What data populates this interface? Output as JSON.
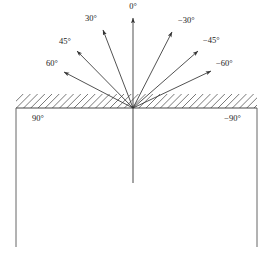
{
  "figure": {
    "background_color": "#ffffff",
    "line_color": "#333333",
    "hatch_color": "#555555",
    "text_color": "#1a1a1a",
    "origin": {
      "x": 133,
      "y": 108
    },
    "surface_line": {
      "x1": 16,
      "y": 108,
      "x2": 257,
      "y2": 108
    },
    "hatch_band": {
      "x": 16,
      "y": 94,
      "width": 241,
      "height": 14,
      "angle_deg": 45
    },
    "box": {
      "x": 16,
      "y": 108,
      "width": 241,
      "height": 139
    },
    "normal_down_line": {
      "x1": 133,
      "y1": 108,
      "x2": 133,
      "y2": 183
    }
  },
  "chart_data": {
    "type": "diagram",
    "xlabel": "",
    "ylabel": "",
    "grid": false,
    "legend": "none",
    "angle_unit": "degrees",
    "categories": [
      "90",
      "60",
      "45",
      "30",
      "0",
      "-30",
      "-45",
      "-60",
      "-90"
    ],
    "values": [
      90,
      60,
      45,
      30,
      0,
      -30,
      -45,
      -60,
      -90
    ],
    "rays": [
      {
        "name": "ray-0",
        "label": "0°",
        "angle_deg": 0,
        "side": "center",
        "tip": {
          "x": 133,
          "y": 18
        },
        "label_pos": {
          "x": 133,
          "y": 9
        },
        "label_anchor": "middle"
      },
      {
        "name": "ray-30",
        "label": "30°",
        "angle_deg": 30,
        "side": "left",
        "tip": {
          "x": 103,
          "y": 30
        },
        "label_pos": {
          "x": 97,
          "y": 21
        },
        "label_anchor": "end"
      },
      {
        "name": "ray-45",
        "label": "45°",
        "angle_deg": 45,
        "side": "left",
        "tip": {
          "x": 77,
          "y": 51
        },
        "label_pos": {
          "x": 71,
          "y": 44
        },
        "label_anchor": "end"
      },
      {
        "name": "ray-60",
        "label": "60°",
        "angle_deg": 60,
        "side": "left",
        "tip": {
          "x": 64,
          "y": 72
        },
        "label_pos": {
          "x": 58,
          "y": 66
        },
        "label_anchor": "end"
      },
      {
        "name": "ray-minus-30",
        "label": "−30°",
        "angle_deg": -30,
        "side": "right",
        "tip": {
          "x": 172,
          "y": 32
        },
        "label_pos": {
          "x": 178,
          "y": 23
        },
        "label_anchor": "start"
      },
      {
        "name": "ray-minus-45",
        "label": "−45°",
        "angle_deg": -45,
        "side": "right",
        "tip": {
          "x": 198,
          "y": 51
        },
        "label_pos": {
          "x": 203,
          "y": 43
        },
        "label_anchor": "start"
      },
      {
        "name": "ray-minus-60",
        "label": "−60°",
        "angle_deg": -60,
        "side": "right",
        "tip": {
          "x": 211,
          "y": 71
        },
        "label_pos": {
          "x": 216,
          "y": 66
        },
        "label_anchor": "start"
      }
    ],
    "surface_labels": [
      {
        "name": "surface-label-90",
        "label": "90°",
        "value": 90,
        "pos": {
          "x": 32,
          "y": 121
        },
        "anchor": "start"
      },
      {
        "name": "surface-label-minus-90",
        "label": "−90°",
        "value": -90,
        "pos": {
          "x": 241,
          "y": 121
        },
        "anchor": "end"
      }
    ]
  }
}
